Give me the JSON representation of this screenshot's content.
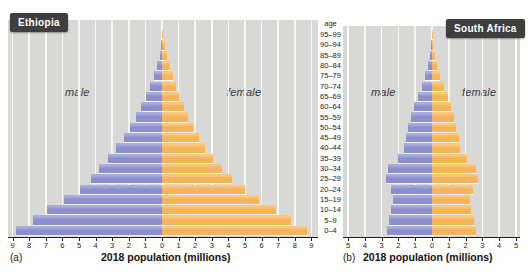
{
  "figure": {
    "panels": [
      {
        "title": "Ethiopia",
        "tag": "(a)",
        "xlabel": "2018 population (millions)",
        "male_label": "male",
        "female_label": "female"
      },
      {
        "title": "South Africa",
        "tag": "(b)",
        "xlabel": "2018 population (millions)",
        "male_label": "male",
        "female_label": "female"
      }
    ],
    "age_axis": {
      "header": "age",
      "groups_top_to_bottom": [
        "95–99",
        "90–94",
        "85–89",
        "80–84",
        "75–79",
        "70–74",
        "65–69",
        "60–64",
        "55–59",
        "50–54",
        "45–49",
        "40–44",
        "35–39",
        "30–34",
        "25–29",
        "20–24",
        "15–19",
        "10–14",
        "5–9",
        "0–4"
      ]
    }
  },
  "chart_data": [
    {
      "type": "bar",
      "subtype": "population-pyramid",
      "title": "Ethiopia",
      "xlabel": "2018 population (millions)",
      "ylabel": "age",
      "categories_bottom_to_top": [
        "0–4",
        "5–9",
        "10–14",
        "15–19",
        "20–24",
        "25–29",
        "30–34",
        "35–39",
        "40–44",
        "45–49",
        "50–54",
        "55–59",
        "60–64",
        "65–69",
        "70–74",
        "75–79",
        "80–84",
        "85–89",
        "90–94",
        "95–99"
      ],
      "series": [
        {
          "name": "male",
          "side": "left",
          "values": [
            8.8,
            7.75,
            6.9,
            5.9,
            4.95,
            4.25,
            3.8,
            3.25,
            2.75,
            2.3,
            1.9,
            1.55,
            1.25,
            0.95,
            0.7,
            0.5,
            0.3,
            0.15,
            0.07,
            0.02
          ]
        },
        {
          "name": "female",
          "side": "right",
          "values": [
            8.75,
            7.8,
            6.85,
            5.85,
            5.0,
            4.2,
            3.6,
            3.05,
            2.6,
            2.2,
            1.85,
            1.55,
            1.3,
            1.05,
            0.85,
            0.65,
            0.5,
            0.33,
            0.17,
            0.05
          ]
        }
      ],
      "xlim_each_side": 9,
      "tick_labels": [
        "9",
        "8",
        "7",
        "6",
        "5",
        "4",
        "3",
        "2",
        "1",
        "0",
        "1",
        "2",
        "3",
        "4",
        "5",
        "6",
        "7",
        "8",
        "9"
      ],
      "grid": true,
      "legend": false
    },
    {
      "type": "bar",
      "subtype": "population-pyramid",
      "title": "South Africa",
      "xlabel": "2018 population (millions)",
      "ylabel": "age",
      "categories_bottom_to_top": [
        "0–4",
        "5–9",
        "10–14",
        "15–19",
        "20–24",
        "25–29",
        "30–34",
        "35–39",
        "40–44",
        "45–49",
        "50–54",
        "55–59",
        "60–64",
        "65–69",
        "70–74",
        "75–79",
        "80–84",
        "85–89",
        "90–94",
        "95–99"
      ],
      "series": [
        {
          "name": "male",
          "side": "left",
          "values": [
            2.65,
            2.55,
            2.45,
            2.3,
            2.45,
            2.75,
            2.6,
            2.05,
            1.65,
            1.55,
            1.4,
            1.25,
            1.05,
            0.85,
            0.6,
            0.4,
            0.22,
            0.12,
            0.05,
            0.02
          ]
        },
        {
          "name": "female",
          "side": "right",
          "values": [
            2.6,
            2.5,
            2.35,
            2.25,
            2.45,
            2.75,
            2.6,
            2.1,
            1.65,
            1.6,
            1.45,
            1.3,
            1.15,
            0.95,
            0.7,
            0.5,
            0.3,
            0.17,
            0.08,
            0.03
          ]
        }
      ],
      "xlim_each_side": 5,
      "tick_labels": [
        "5",
        "4",
        "3",
        "2",
        "1",
        "0",
        "1",
        "2",
        "3",
        "4",
        "5"
      ],
      "grid": true,
      "legend": false
    }
  ],
  "colors": {
    "male_bar": "#8b8fce",
    "male_bar_highlight": "#a9acdf",
    "female_bar": "#f5b45a",
    "female_bar_highlight": "#f9c87f",
    "plot_background": "#d8d8d7",
    "gridline": "#f6f6f3",
    "axis_line": "#1c1c1c",
    "title_box_background": "#3e3e3e",
    "title_box_text": "#ffffff"
  }
}
